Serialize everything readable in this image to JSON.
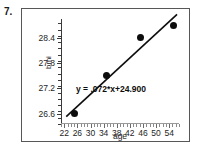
{
  "question_number": "7.",
  "chart_data": {
    "type": "scatter",
    "title": "",
    "xlabel": "age",
    "ylabel": "bmi",
    "xlim": [
      21,
      57
    ],
    "ylim": [
      26.35,
      28.85
    ],
    "grid": false,
    "legend": null,
    "x_ticks": [
      22,
      26,
      30,
      34,
      38,
      42,
      46,
      50,
      54
    ],
    "x_tick_labels": [
      "22",
      "26",
      "30",
      "34",
      "38",
      "42",
      "46",
      "50",
      "54"
    ],
    "x_minor_tick_step": 1,
    "y_ticks": [
      26.6,
      27.2,
      27.8,
      28.4
    ],
    "y_tick_labels": [
      "26.6",
      "27.2",
      "27.8",
      "28.4"
    ],
    "y_minor_tick_step": 0.15,
    "points": [
      {
        "x": 25.2,
        "y": 26.6
      },
      {
        "x": 35.0,
        "y": 27.5
      },
      {
        "x": 45.2,
        "y": 28.4
      },
      {
        "x": 55.3,
        "y": 28.7
      }
    ],
    "trendline": {
      "slope": 0.072,
      "intercept": 24.9,
      "x_start": 22.6,
      "x_end": 56.4,
      "annotation": "y = .072*x+24.900"
    }
  }
}
